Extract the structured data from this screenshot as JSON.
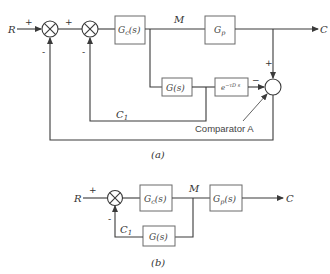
{
  "diagram_a": {
    "caption": "(a)",
    "input_label": "R",
    "output_label": "C",
    "signal_m_label": "M",
    "signal_c1_label": "C",
    "signal_c1_sub": "1",
    "plus_1": "+",
    "plus_2": "+",
    "minus_1": "-",
    "minus_2": "-",
    "comparator_plus": "+",
    "comparator_minus": "−",
    "comparator_label": "Comparator A",
    "blocks": {
      "controller": "G",
      "controller_sub": "c",
      "controller_arg": "(s)",
      "process": "G",
      "process_sub": "p",
      "model": "G(s)",
      "delay": "e",
      "delay_exp": "−τD s"
    }
  },
  "diagram_b": {
    "caption": "(b)",
    "input_label": "R",
    "output_label": "C",
    "signal_m_label": "M",
    "signal_c1_label": "C",
    "signal_c1_sub": "1",
    "plus": "+",
    "minus": "-",
    "blocks": {
      "controller": "G",
      "controller_sub": "c",
      "controller_arg": "(s)",
      "process": "G",
      "process_sub": "p",
      "process_arg": "(s)",
      "feedback": "G(s)"
    }
  }
}
